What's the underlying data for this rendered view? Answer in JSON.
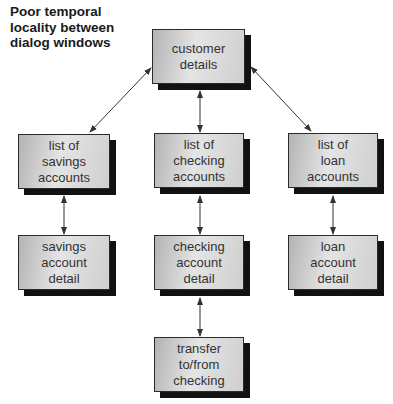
{
  "title": "Poor temporal\nlocality between\ndialog windows",
  "nodes": {
    "customer": "customer\ndetails",
    "savings_list": "list of\nsavings\naccounts",
    "checking_list": "list of\nchecking\naccounts",
    "loan_list": "list of\nloan\naccounts",
    "savings_detail": "savings\naccount\ndetail",
    "checking_detail": "checking\naccount\ndetail",
    "loan_detail": "loan\naccount\ndetail",
    "transfer": "transfer\nto/from\nchecking"
  },
  "edges": [
    [
      "customer",
      "savings_list"
    ],
    [
      "customer",
      "checking_list"
    ],
    [
      "customer",
      "loan_list"
    ],
    [
      "savings_list",
      "savings_detail"
    ],
    [
      "checking_list",
      "checking_detail"
    ],
    [
      "loan_list",
      "loan_detail"
    ],
    [
      "checking_detail",
      "transfer"
    ]
  ],
  "colors": {
    "box_border": "#2a2a2a",
    "shadow": "#111111",
    "arrow": "#333333"
  }
}
